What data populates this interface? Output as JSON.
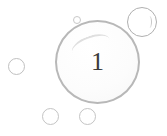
{
  "badge": {
    "number": "1"
  },
  "colors": {
    "bubble_stroke": "#b8b8b8",
    "number_color": "#3a3a3a",
    "background": "#ffffff"
  }
}
